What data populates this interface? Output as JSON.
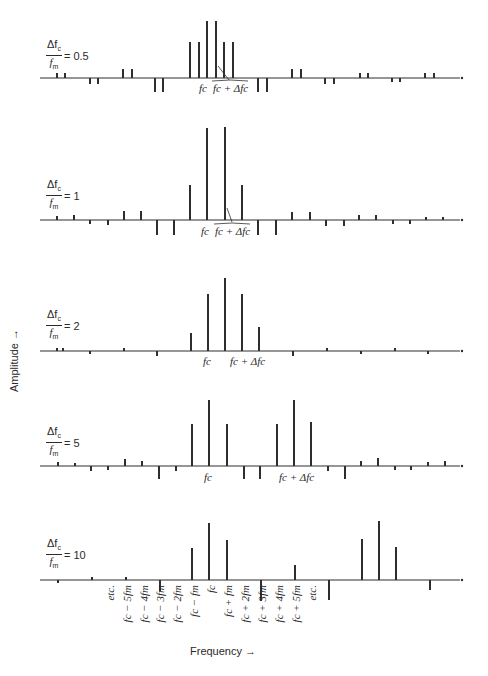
{
  "figure": {
    "y_axis_label": "Amplitude",
    "y_axis_arrow": "→",
    "x_axis_label": "Frequency",
    "x_axis_arrow": "→"
  },
  "panels": [
    {
      "ratio_numerator": "Δf",
      "ratio_sub": "c",
      "ratio_denominator": "f",
      "ratio_den_sub": "m",
      "ratio_value": "= 0.5",
      "baseline_y": 78,
      "label_fc": "f",
      "label_fc_sub": "c",
      "label_fc_delta": "f c + Δf c",
      "lines": [
        {
          "x": 57,
          "h": 5
        },
        {
          "x": 65,
          "h": 5
        },
        {
          "x": 90,
          "h": -6
        },
        {
          "x": 98,
          "h": -6
        },
        {
          "x": 123,
          "h": 9
        },
        {
          "x": 132,
          "h": 9
        },
        {
          "x": 155,
          "h": -14
        },
        {
          "x": 163,
          "h": -14
        },
        {
          "x": 190,
          "h": 36
        },
        {
          "x": 199,
          "h": 36
        },
        {
          "x": 207,
          "h": 57
        },
        {
          "x": 216,
          "h": 57
        },
        {
          "x": 224,
          "h": 36
        },
        {
          "x": 233,
          "h": 36
        },
        {
          "x": 258,
          "h": -14
        },
        {
          "x": 267,
          "h": -14
        },
        {
          "x": 292,
          "h": 9
        },
        {
          "x": 301,
          "h": 9
        },
        {
          "x": 325,
          "h": -6
        },
        {
          "x": 334,
          "h": -6
        },
        {
          "x": 360,
          "h": 5
        },
        {
          "x": 368,
          "h": 5
        },
        {
          "x": 392,
          "h": -4
        },
        {
          "x": 400,
          "h": -4
        },
        {
          "x": 425,
          "h": 5
        },
        {
          "x": 434,
          "h": 5
        }
      ]
    },
    {
      "ratio_numerator": "Δf",
      "ratio_sub": "c",
      "ratio_denominator": "f",
      "ratio_den_sub": "m",
      "ratio_value": "= 1",
      "baseline_y": 220,
      "label_fc": "f",
      "label_fc_sub": "c",
      "lines": [
        {
          "x": 57,
          "h": 4
        },
        {
          "x": 74,
          "h": 5
        },
        {
          "x": 90,
          "h": -4
        },
        {
          "x": 108,
          "h": -5
        },
        {
          "x": 124,
          "h": 9
        },
        {
          "x": 141,
          "h": 9
        },
        {
          "x": 157,
          "h": -15
        },
        {
          "x": 174,
          "h": -15
        },
        {
          "x": 190,
          "h": 35
        },
        {
          "x": 207,
          "h": 92
        },
        {
          "x": 225,
          "h": 93
        },
        {
          "x": 242,
          "h": 35
        },
        {
          "x": 258,
          "h": -15
        },
        {
          "x": 276,
          "h": -15
        },
        {
          "x": 292,
          "h": 8
        },
        {
          "x": 310,
          "h": 8
        },
        {
          "x": 326,
          "h": -6
        },
        {
          "x": 344,
          "h": -6
        },
        {
          "x": 359,
          "h": 5
        },
        {
          "x": 376,
          "h": 5
        },
        {
          "x": 393,
          "h": -4
        },
        {
          "x": 410,
          "h": -4
        },
        {
          "x": 426,
          "h": 3
        },
        {
          "x": 443,
          "h": 3
        }
      ]
    },
    {
      "ratio_numerator": "Δf",
      "ratio_sub": "c",
      "ratio_denominator": "f",
      "ratio_den_sub": "m",
      "ratio_value": "= 2",
      "baseline_y": 351,
      "label_fc": "f",
      "label_fc_sub": "c",
      "lines": [
        {
          "x": 57,
          "h": 3
        },
        {
          "x": 63,
          "h": 3
        },
        {
          "x": 90,
          "h": -3
        },
        {
          "x": 124,
          "h": 3
        },
        {
          "x": 157,
          "h": -5
        },
        {
          "x": 191,
          "h": 18
        },
        {
          "x": 208,
          "h": 57
        },
        {
          "x": 225,
          "h": 73
        },
        {
          "x": 242,
          "h": 57
        },
        {
          "x": 259,
          "h": 24
        },
        {
          "x": 293,
          "h": -5
        },
        {
          "x": 327,
          "h": 3
        },
        {
          "x": 361,
          "h": -3
        },
        {
          "x": 395,
          "h": 3
        },
        {
          "x": 428,
          "h": -3
        }
      ]
    },
    {
      "ratio_numerator": "Δf",
      "ratio_sub": "c",
      "ratio_denominator": "f",
      "ratio_den_sub": "m",
      "ratio_value": "= 5",
      "baseline_y": 466,
      "label_fc": "f",
      "label_fc_sub": "c",
      "lines": [
        {
          "x": 58,
          "h": 4
        },
        {
          "x": 75,
          "h": 3
        },
        {
          "x": 91,
          "h": -5
        },
        {
          "x": 108,
          "h": -4
        },
        {
          "x": 125,
          "h": 7
        },
        {
          "x": 142,
          "h": 5
        },
        {
          "x": 159,
          "h": -13
        },
        {
          "x": 176,
          "h": -5
        },
        {
          "x": 192,
          "h": 42
        },
        {
          "x": 209,
          "h": 66
        },
        {
          "x": 227,
          "h": 42
        },
        {
          "x": 244,
          "h": -13
        },
        {
          "x": 260,
          "h": -13
        },
        {
          "x": 277,
          "h": 42
        },
        {
          "x": 294,
          "h": 66
        },
        {
          "x": 311,
          "h": 44
        },
        {
          "x": 328,
          "h": -5
        },
        {
          "x": 345,
          "h": -13
        },
        {
          "x": 361,
          "h": 5
        },
        {
          "x": 378,
          "h": 8
        },
        {
          "x": 395,
          "h": -4
        },
        {
          "x": 411,
          "h": -4
        },
        {
          "x": 428,
          "h": 4
        },
        {
          "x": 445,
          "h": 5
        }
      ]
    },
    {
      "ratio_numerator": "Δf",
      "ratio_sub": "c",
      "ratio_denominator": "f",
      "ratio_den_sub": "m",
      "ratio_value": "= 10",
      "baseline_y": 580,
      "lines": [
        {
          "x": 58,
          "h": -3
        },
        {
          "x": 92,
          "h": 3
        },
        {
          "x": 126,
          "h": 3
        },
        {
          "x": 160,
          "h": -11
        },
        {
          "x": 192,
          "h": 32
        },
        {
          "x": 209,
          "h": 57
        },
        {
          "x": 227,
          "h": 40
        },
        {
          "x": 261,
          "h": -21
        },
        {
          "x": 295,
          "h": 15
        },
        {
          "x": 329,
          "h": -20
        },
        {
          "x": 362,
          "h": 41
        },
        {
          "x": 379,
          "h": 59
        },
        {
          "x": 396,
          "h": 33
        },
        {
          "x": 430,
          "h": -10
        }
      ],
      "freq_labels": [
        {
          "x": 110,
          "text": "etc."
        },
        {
          "x": 127,
          "text": "fc − 5fm"
        },
        {
          "x": 144,
          "text": "fc − 4fm"
        },
        {
          "x": 160,
          "text": "fc − 3fm"
        },
        {
          "x": 177,
          "text": "fc − 2fm"
        },
        {
          "x": 194,
          "text": "fc − fm"
        },
        {
          "x": 211,
          "text": "fc"
        },
        {
          "x": 228,
          "text": "fc + fm"
        },
        {
          "x": 245,
          "text": "fc + 2fm"
        },
        {
          "x": 262,
          "text": "fc + 3fm"
        },
        {
          "x": 279,
          "text": "fc + 4fm"
        },
        {
          "x": 296,
          "text": "fc + 5fm"
        },
        {
          "x": 312,
          "text": "etc."
        }
      ]
    }
  ],
  "annotations": {
    "fc": "fc",
    "fc_plus_delta": "fc + Δfc"
  }
}
